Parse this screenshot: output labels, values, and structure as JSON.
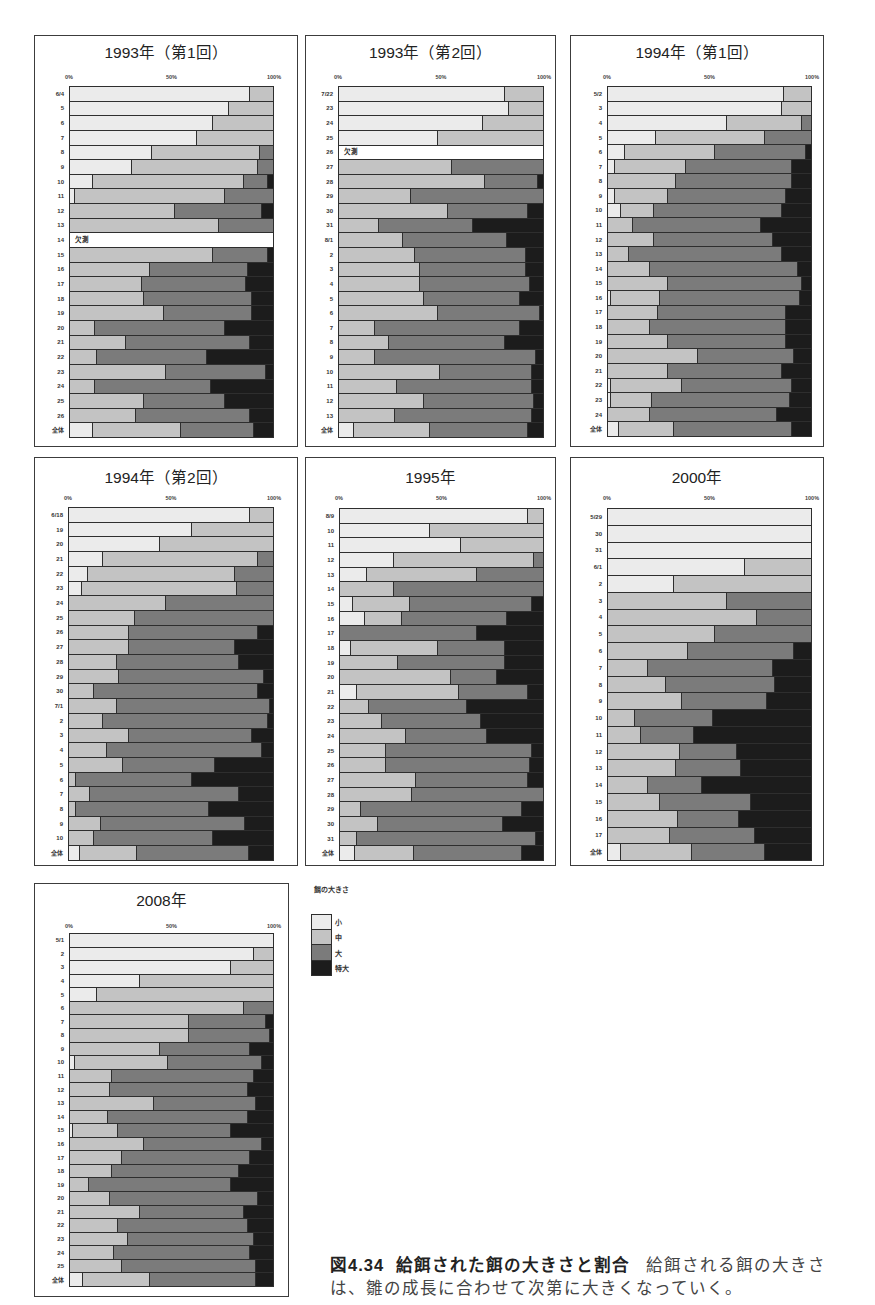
{
  "legend": {
    "title": "餌の大きさ",
    "items": [
      {
        "label": "小",
        "color": "#f3f3f3"
      },
      {
        "label": "中",
        "color": "#c9c9c9"
      },
      {
        "label": "大",
        "color": "#7b7b7b"
      },
      {
        "label": "特大",
        "color": "#1c1c1c"
      }
    ]
  },
  "missing_label": "欠測",
  "caption": {
    "figure_number": "図4.34",
    "title": "給餌された餌の大きさと割合",
    "body_line1": "給餌される餌の大きさ",
    "body_line2": "は、雛の成長に合わせて次第に大きくなっていく。"
  },
  "chart_data": [
    {
      "type": "bar",
      "orientation": "horizontal",
      "stacked": true,
      "title": "1993年（第1回）",
      "xticks": [
        "0%",
        "50%",
        "100%"
      ],
      "xlim": [
        0,
        100
      ],
      "xlabel": "",
      "ylabel": "",
      "legend_title": "餌の大きさ",
      "missing_categories": [
        "14"
      ],
      "categories": [
        "6/4",
        "5",
        "6",
        "7",
        "8",
        "9",
        "10",
        "11",
        "12",
        "13",
        "14",
        "15",
        "16",
        "17",
        "18",
        "19",
        "20",
        "21",
        "22",
        "23",
        "24",
        "25",
        "26",
        "全体"
      ],
      "series": [
        {
          "name": "小",
          "values": [
            88,
            78,
            70,
            62,
            40,
            30,
            11,
            2,
            0,
            0,
            null,
            0,
            0,
            0,
            0,
            0,
            0,
            0,
            0,
            0,
            0,
            0,
            0,
            11
          ]
        },
        {
          "name": "中",
          "values": [
            12,
            22,
            30,
            38,
            53,
            62,
            74,
            74,
            51,
            73,
            null,
            70,
            39,
            35,
            36,
            46,
            12,
            27,
            13,
            47,
            12,
            36,
            32,
            43
          ]
        },
        {
          "name": "大",
          "values": [
            0,
            0,
            0,
            0,
            7,
            8,
            12,
            24,
            43,
            27,
            null,
            27,
            48,
            51,
            53,
            43,
            64,
            61,
            54,
            49,
            57,
            40,
            56,
            36
          ]
        },
        {
          "name": "特大",
          "values": [
            0,
            0,
            0,
            0,
            0,
            0,
            3,
            0,
            6,
            0,
            null,
            3,
            13,
            14,
            11,
            11,
            24,
            12,
            33,
            4,
            31,
            24,
            12,
            10
          ]
        }
      ]
    },
    {
      "type": "bar",
      "orientation": "horizontal",
      "stacked": true,
      "title": "1993年（第2回）",
      "xticks": [
        "0%",
        "50%",
        "100%"
      ],
      "xlim": [
        0,
        100
      ],
      "xlabel": "",
      "ylabel": "",
      "legend_title": "餌の大きさ",
      "missing_categories": [
        "26"
      ],
      "categories": [
        "7/22",
        "23",
        "24",
        "25",
        "26",
        "27",
        "28",
        "29",
        "30",
        "31",
        "8/1",
        "2",
        "3",
        "4",
        "5",
        "6",
        "7",
        "8",
        "9",
        "10",
        "11",
        "12",
        "13",
        "全体"
      ],
      "series": [
        {
          "name": "小",
          "values": [
            81,
            83,
            70,
            48,
            null,
            0,
            0,
            0,
            0,
            0,
            0,
            0,
            0,
            0,
            0,
            0,
            0,
            0,
            0,
            0,
            0,
            0,
            0,
            7
          ]
        },
        {
          "name": "中",
          "values": [
            19,
            17,
            30,
            52,
            null,
            55,
            71,
            35,
            53,
            19,
            31,
            37,
            39,
            39,
            41,
            48,
            17,
            24,
            17,
            49,
            28,
            41,
            27,
            37
          ]
        },
        {
          "name": "大",
          "values": [
            0,
            0,
            0,
            0,
            null,
            45,
            26,
            65,
            39,
            46,
            51,
            54,
            52,
            54,
            47,
            50,
            71,
            57,
            79,
            45,
            66,
            54,
            67,
            48
          ]
        },
        {
          "name": "特大",
          "values": [
            0,
            0,
            0,
            0,
            null,
            0,
            3,
            0,
            8,
            35,
            18,
            9,
            9,
            7,
            12,
            2,
            12,
            19,
            4,
            6,
            6,
            5,
            6,
            8
          ]
        }
      ]
    },
    {
      "type": "bar",
      "orientation": "horizontal",
      "stacked": true,
      "title": "1994年（第1回）",
      "xticks": [
        "0%",
        "50%",
        "100%"
      ],
      "xlim": [
        0,
        100
      ],
      "xlabel": "",
      "ylabel": "",
      "legend_title": "餌の大きさ",
      "categories": [
        "5/2",
        "3",
        "4",
        "5",
        "6",
        "7",
        "8",
        "9",
        "10",
        "11",
        "12",
        "13",
        "14",
        "15",
        "16",
        "17",
        "18",
        "19",
        "20",
        "21",
        "22",
        "23",
        "24",
        "全体"
      ],
      "series": [
        {
          "name": "小",
          "values": [
            86,
            85,
            58,
            23,
            8,
            3,
            0,
            3,
            6,
            0,
            0,
            0,
            0,
            0,
            1,
            0,
            0,
            0,
            0,
            0,
            1,
            1,
            0,
            5
          ]
        },
        {
          "name": "中",
          "values": [
            14,
            15,
            37,
            54,
            44,
            35,
            33,
            26,
            16,
            12,
            22,
            10,
            20,
            29,
            24,
            24,
            20,
            29,
            44,
            29,
            35,
            20,
            20,
            27
          ]
        },
        {
          "name": "大",
          "values": [
            0,
            0,
            5,
            23,
            45,
            52,
            57,
            58,
            63,
            63,
            59,
            75,
            73,
            66,
            69,
            63,
            67,
            58,
            47,
            56,
            54,
            68,
            63,
            58
          ]
        },
        {
          "name": "特大",
          "values": [
            0,
            0,
            0,
            0,
            3,
            10,
            10,
            13,
            15,
            25,
            19,
            15,
            7,
            5,
            6,
            13,
            13,
            13,
            9,
            15,
            10,
            11,
            17,
            10
          ]
        }
      ]
    },
    {
      "type": "bar",
      "orientation": "horizontal",
      "stacked": true,
      "title": "1994年（第2回）",
      "xticks": [
        "0%",
        "50%",
        "100%"
      ],
      "xlim": [
        0,
        100
      ],
      "xlabel": "",
      "ylabel": "",
      "legend_title": "餌の大きさ",
      "categories": [
        "6/18",
        "19",
        "20",
        "21",
        "22",
        "23",
        "24",
        "25",
        "26",
        "27",
        "28",
        "29",
        "30",
        "7/1",
        "2",
        "3",
        "4",
        "5",
        "6",
        "7",
        "8",
        "9",
        "10",
        "全体"
      ],
      "series": [
        {
          "name": "小",
          "values": [
            88,
            60,
            44,
            16,
            9,
            6,
            0,
            0,
            0,
            0,
            0,
            0,
            0,
            0,
            0,
            0,
            0,
            0,
            0,
            0,
            0,
            0,
            0,
            5
          ]
        },
        {
          "name": "中",
          "values": [
            12,
            40,
            56,
            76,
            72,
            76,
            47,
            32,
            29,
            29,
            23,
            24,
            12,
            23,
            16,
            29,
            18,
            26,
            3,
            10,
            3,
            15,
            12,
            28
          ]
        },
        {
          "name": "大",
          "values": [
            0,
            0,
            0,
            8,
            19,
            18,
            53,
            68,
            63,
            52,
            60,
            71,
            80,
            75,
            81,
            60,
            76,
            45,
            57,
            73,
            65,
            71,
            58,
            55
          ]
        },
        {
          "name": "特大",
          "values": [
            0,
            0,
            0,
            0,
            0,
            0,
            0,
            0,
            8,
            19,
            17,
            5,
            8,
            2,
            3,
            11,
            6,
            29,
            40,
            17,
            32,
            14,
            30,
            12
          ]
        }
      ]
    },
    {
      "type": "bar",
      "orientation": "horizontal",
      "stacked": true,
      "title": "1995年",
      "xticks": [
        "0%",
        "50%",
        "100%"
      ],
      "xlim": [
        0,
        100
      ],
      "xlabel": "",
      "ylabel": "",
      "legend_title": "餌の大きさ",
      "categories": [
        "8/9",
        "10",
        "11",
        "12",
        "13",
        "14",
        "15",
        "16",
        "17",
        "18",
        "19",
        "20",
        "21",
        "22",
        "23",
        "24",
        "25",
        "26",
        "27",
        "28",
        "29",
        "30",
        "31",
        "全体"
      ],
      "series": [
        {
          "name": "小",
          "values": [
            92,
            44,
            59,
            26,
            13,
            0,
            6,
            12,
            0,
            5,
            0,
            0,
            8,
            0,
            0,
            0,
            0,
            0,
            0,
            0,
            0,
            0,
            0,
            7
          ]
        },
        {
          "name": "中",
          "values": [
            8,
            56,
            41,
            69,
            54,
            26,
            28,
            18,
            0,
            43,
            28,
            54,
            50,
            14,
            20,
            32,
            22,
            22,
            37,
            35,
            10,
            18,
            8,
            29
          ]
        },
        {
          "name": "大",
          "values": [
            0,
            0,
            0,
            5,
            33,
            74,
            60,
            52,
            67,
            33,
            53,
            23,
            34,
            48,
            49,
            40,
            72,
            71,
            55,
            65,
            79,
            62,
            88,
            53
          ]
        },
        {
          "name": "特大",
          "values": [
            0,
            0,
            0,
            0,
            0,
            0,
            6,
            18,
            33,
            19,
            19,
            23,
            8,
            38,
            31,
            28,
            6,
            7,
            8,
            0,
            11,
            20,
            4,
            11
          ]
        }
      ]
    },
    {
      "type": "bar",
      "orientation": "horizontal",
      "stacked": true,
      "title": "2000年",
      "xticks": [
        "0%",
        "50%",
        "100%"
      ],
      "xlim": [
        0,
        100
      ],
      "xlabel": "",
      "ylabel": "",
      "legend_title": "餌の大きさ",
      "categories": [
        "5/29",
        "30",
        "31",
        "6/1",
        "2",
        "3",
        "4",
        "5",
        "6",
        "7",
        "8",
        "9",
        "10",
        "11",
        "12",
        "13",
        "14",
        "15",
        "16",
        "17",
        "全体"
      ],
      "series": [
        {
          "name": "小",
          "values": [
            100,
            100,
            100,
            67,
            32,
            0,
            0,
            0,
            0,
            0,
            0,
            0,
            0,
            0,
            0,
            0,
            0,
            0,
            0,
            0,
            6
          ]
        },
        {
          "name": "中",
          "values": [
            0,
            0,
            0,
            33,
            68,
            58,
            73,
            52,
            39,
            19,
            28,
            36,
            13,
            16,
            35,
            33,
            19,
            25,
            34,
            30,
            35
          ]
        },
        {
          "name": "大",
          "values": [
            0,
            0,
            0,
            0,
            0,
            42,
            27,
            48,
            52,
            62,
            54,
            42,
            38,
            26,
            28,
            32,
            27,
            45,
            30,
            42,
            36
          ]
        },
        {
          "name": "特大",
          "values": [
            0,
            0,
            0,
            0,
            0,
            0,
            0,
            0,
            9,
            19,
            18,
            22,
            49,
            58,
            37,
            35,
            54,
            30,
            36,
            28,
            23
          ]
        }
      ]
    },
    {
      "type": "bar",
      "orientation": "horizontal",
      "stacked": true,
      "title": "2008年",
      "xticks": [
        "0%",
        "50%",
        "100%"
      ],
      "xlim": [
        0,
        100
      ],
      "xlabel": "",
      "ylabel": "",
      "legend_title": "餌の大きさ",
      "categories": [
        "5/1",
        "2",
        "3",
        "4",
        "5",
        "6",
        "7",
        "8",
        "9",
        "10",
        "11",
        "12",
        "13",
        "14",
        "15",
        "16",
        "17",
        "18",
        "19",
        "20",
        "21",
        "22",
        "23",
        "24",
        "25",
        "全体"
      ],
      "series": [
        {
          "name": "小",
          "values": [
            100,
            90,
            79,
            34,
            13,
            0,
            0,
            0,
            0,
            2,
            0,
            0,
            0,
            0,
            1,
            0,
            0,
            0,
            0,
            0,
            0,
            0,
            0,
            0,
            0,
            6
          ]
        },
        {
          "name": "中",
          "values": [
            0,
            10,
            21,
            66,
            87,
            85,
            58,
            58,
            44,
            46,
            20,
            19,
            41,
            18,
            22,
            36,
            25,
            20,
            9,
            19,
            34,
            23,
            28,
            21,
            25,
            33
          ]
        },
        {
          "name": "大",
          "values": [
            0,
            0,
            0,
            0,
            0,
            15,
            38,
            40,
            44,
            46,
            70,
            68,
            50,
            69,
            56,
            58,
            63,
            63,
            70,
            73,
            51,
            64,
            62,
            67,
            66,
            52
          ]
        },
        {
          "name": "特大",
          "values": [
            0,
            0,
            0,
            0,
            0,
            0,
            4,
            2,
            12,
            6,
            10,
            13,
            9,
            13,
            21,
            6,
            12,
            17,
            21,
            8,
            15,
            13,
            10,
            12,
            9,
            9
          ]
        }
      ]
    }
  ]
}
